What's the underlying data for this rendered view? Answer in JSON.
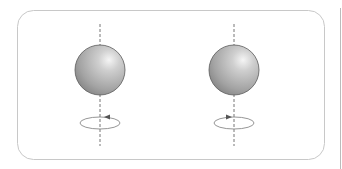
{
  "diagram": {
    "colors": {
      "frame": "#c8c8c8",
      "axis": "#777777",
      "sphere_dark": "#7a7a7a",
      "sphere_light": "#f2f2f2",
      "rotation_arrow": "#888888"
    },
    "spheres": [
      {
        "id": "left",
        "cx": 100,
        "cy": 70,
        "r": 25,
        "arrow_direction": "left"
      },
      {
        "id": "right",
        "cx": 234,
        "cy": 70,
        "r": 25,
        "arrow_direction": "right"
      }
    ]
  }
}
